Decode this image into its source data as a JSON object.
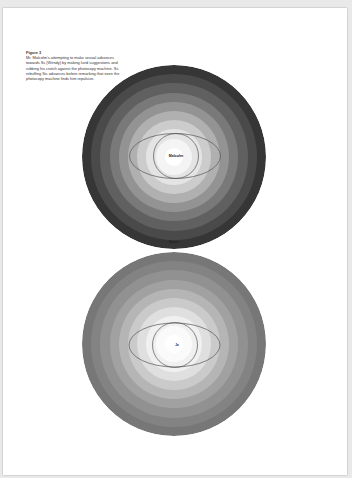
{
  "caption": {
    "title": "Figure 3",
    "body": "Mr. Malcolm's attempting to make sexual advances towards Ss (Wendy) by making lurid suggestions and rubbing his crotch against the photocopy machine. Ss rebuffing Sis advances before remarking that even the photocopy machine finds him repulsive."
  },
  "figures": [
    {
      "id": "top",
      "center_label": "Malcolm",
      "bottom_label": "Space",
      "ring_colors": [
        "#363636",
        "#4a4a4a",
        "#606060",
        "#797979",
        "#939393",
        "#b0b0b0",
        "#cccccc",
        "#e4e4e4",
        "#f4f4f4",
        "#ffffff"
      ]
    },
    {
      "id": "bottom",
      "center_label": "Ja",
      "ring_colors": [
        "#777777",
        "#838383",
        "#919191",
        "#a1a1a1",
        "#b5b5b5",
        "#cacaca",
        "#dfdfdf",
        "#f0f0f0",
        "#fafafa",
        "#ffffff"
      ]
    }
  ]
}
